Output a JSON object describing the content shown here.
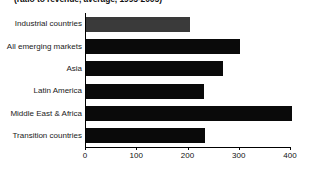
{
  "chart_data": {
    "type": "bar",
    "orientation": "horizontal",
    "title": "",
    "subtitle": "(ratio to revenue, average, 1995-2005)",
    "xlabel": "",
    "ylabel": "",
    "xlim": [
      0,
      400
    ],
    "ylim": null,
    "grid": false,
    "legend": false,
    "xticks": [
      0,
      100,
      200,
      300,
      400
    ],
    "xtick_labels": [
      "0",
      "100",
      "200",
      "300",
      "400"
    ],
    "categories": [
      "Industrial countries",
      "All emerging markets",
      "Asia",
      "Latin America",
      "Middle East & Africa",
      "Transition countries"
    ],
    "values": [
      205,
      302,
      269,
      232,
      404,
      234
    ],
    "bar_colors": [
      "#3a3a3a",
      "#0a0a0a",
      "#0a0a0a",
      "#0a0a0a",
      "#0a0a0a",
      "#0a0a0a"
    ],
    "colors": {
      "highlight_bar": "#3a3a3a",
      "default_bar": "#0a0a0a",
      "axis": "#000000",
      "text": "#1a1a1a",
      "background": "#ffffff"
    }
  }
}
